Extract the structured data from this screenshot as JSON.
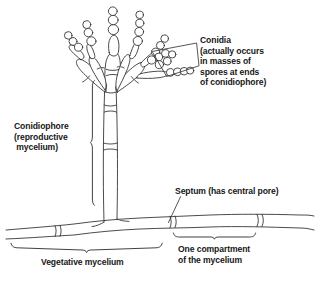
{
  "figure": {
    "type": "diagram",
    "style": "black-and-white line drawing"
  },
  "labels": {
    "conidia": {
      "name": "conidia-label",
      "lines": [
        "Conidia",
        "(actually occurs",
        "in masses of",
        "spores at ends",
        "of conidiophore)"
      ]
    },
    "conidiophore": {
      "name": "conidiophore-label",
      "lines": [
        "Conidiophore",
        "(reproductive",
        " mycelium)"
      ]
    },
    "septum": {
      "name": "septum-label",
      "lines": [
        "Septum (has central pore)"
      ]
    },
    "compartment": {
      "name": "compartment-label",
      "lines": [
        "One compartment",
        "of the mycelium"
      ]
    },
    "vegetative": {
      "name": "vegetative-mycelium-label",
      "lines": [
        "Vegetative mycelium"
      ]
    }
  },
  "colors": {
    "ink": "#1a1a1a",
    "stroke": "#2b2b2b",
    "fill": "#ffffff",
    "background": "#ffffff"
  },
  "annotations": {
    "conidia_pointer": "quadrilateral bracket enclosing spore mass at right branch",
    "conidiophore_bracket": "vertical bracket spanning the upright stalk",
    "septum_leader": "diagonal leader line to a cross-wall on the horizontal hypha",
    "compartment_brace": "horizontal brace spanning one cell of the hypha",
    "vegetative_brace": "horizontal brace spanning the lower horizontal hypha"
  }
}
